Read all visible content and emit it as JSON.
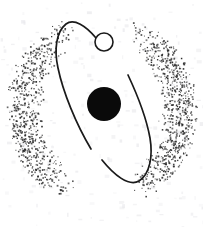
{
  "figure": {
    "canvas": {
      "width": 203,
      "height": 227
    },
    "background_color": "#ffffff",
    "ink_color": "#1a1a1a",
    "stipple_color": "#2b2b2b",
    "nucleus_color": "#0a0a0a",
    "satellite_fill": "#ffffff"
  },
  "elements": {
    "nucleus": {
      "name": "nucleus",
      "shape": "filled-circle",
      "cx": 104,
      "cy": 104,
      "r": 17
    },
    "satellite": {
      "name": "satellite",
      "shape": "open-circle",
      "cx": 104,
      "cy": 42,
      "r": 9,
      "stroke_width": 1.6
    },
    "orbit_left": {
      "name": "left-orbit-arc",
      "stroke_width": 1.7,
      "path": "M 96 38 C 86 26, 74 18, 66 24 C 56 32, 54 50, 58 68 C 63 92, 76 124, 91 149",
      "start_point": [
        96,
        38
      ],
      "end_point": [
        91,
        149
      ],
      "leftmost_x": 56
    },
    "orbit_right": {
      "name": "right-orbit-arc",
      "stroke_width": 1.7,
      "path": "M 128 75 C 136 92, 146 116, 150 138 C 153 156, 150 174, 139 181 C 129 187, 114 175, 102 160",
      "start_point": [
        128,
        75
      ],
      "end_point": [
        102,
        160
      ],
      "rightmost_x": 150
    },
    "halo": {
      "name": "stipple-halo",
      "shape": "broken-annulus",
      "center": [
        101,
        110
      ],
      "outer_radius": 95,
      "inner_radius": 58,
      "dot_count": 1450,
      "dot_size": [
        0.9,
        1.8
      ],
      "gaps_degrees": [
        [
          250,
          290
        ],
        [
          70,
          110
        ]
      ]
    },
    "paper_noise": {
      "name": "scan-noise",
      "dot_count": 240,
      "color": "#e9e9ec"
    }
  }
}
